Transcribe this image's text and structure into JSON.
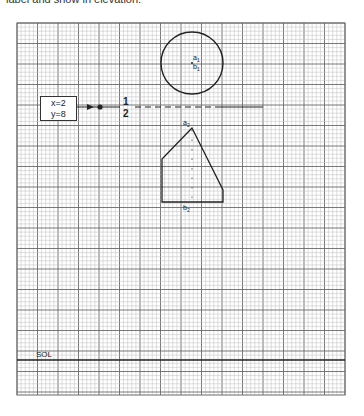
{
  "caption": "label and show in elevation.",
  "grid": {
    "left": 17,
    "top": 23,
    "right": 345,
    "bottom": 395,
    "minor": 4.1,
    "major_every": 5,
    "minor_color": "#bdbdbd",
    "major_color": "#6a6a6a"
  },
  "coordinate_box": {
    "x_label": "x=2",
    "y_label": "y=8"
  },
  "reference_line": {
    "label_top": "1",
    "label_bottom": "2"
  },
  "plan_view": {
    "shape": "circle",
    "label_a": "a",
    "label_a_sub": "1",
    "label_b": "b",
    "label_b_sub": "1"
  },
  "elevation_view": {
    "shape": "pentagon",
    "label_a": "a",
    "label_a_sub": "2",
    "label_b": "b",
    "label_b_sub": "2"
  },
  "ground_line": {
    "label": "SOL"
  },
  "colors": {
    "ink": "#222222",
    "background": "#ffffff"
  }
}
